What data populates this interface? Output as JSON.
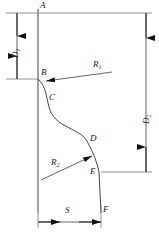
{
  "diagram": {
    "stroke_color": "#333333",
    "text_color": "#1a1a1a",
    "background_color": "#ffffff",
    "points": [
      {
        "id": "point-a",
        "label": "A",
        "x": 41,
        "y": 9,
        "label_x": 40,
        "label_y": 1
      },
      {
        "id": "point-b",
        "label": "B",
        "x": 38,
        "y": 79,
        "label_x": 41,
        "label_y": 68
      },
      {
        "id": "point-c",
        "label": "C",
        "x": 47,
        "y": 100,
        "label_x": 49,
        "label_y": 93
      },
      {
        "id": "point-d",
        "label": "D",
        "x": 88,
        "y": 143,
        "label_x": 90,
        "label_y": 134
      },
      {
        "id": "point-e",
        "label": "E",
        "x": 99,
        "y": 172,
        "label_x": 90,
        "label_y": 167
      },
      {
        "id": "point-f",
        "label": "F",
        "x": 101,
        "y": 213,
        "label_x": 103,
        "label_y": 205
      }
    ],
    "dimensions": [
      {
        "id": "dimension-d1",
        "label": "D",
        "subscript": "1",
        "orientation": "vertical",
        "side": "left",
        "label_x": 11,
        "label_y": 52
      },
      {
        "id": "dimension-d2",
        "label": "D",
        "subscript": "2",
        "orientation": "vertical",
        "side": "right",
        "label_x": 142,
        "label_y": 117
      },
      {
        "id": "dimension-s",
        "label": "S",
        "subscript": "",
        "orientation": "horizontal",
        "side": "bottom",
        "label_x": 65,
        "label_y": 206
      }
    ],
    "radii": [
      {
        "id": "radius-r1",
        "label": "R",
        "subscript": "1",
        "label_x": 93,
        "label_y": 60,
        "leader_from_x": 112,
        "leader_from_y": 72,
        "leader_to_x": 44,
        "leader_to_y": 81
      },
      {
        "id": "radius-r2",
        "label": "R",
        "subscript": "2",
        "label_x": 51,
        "label_y": 158,
        "leader_from_x": 41,
        "leader_from_y": 180,
        "leader_to_x": 93,
        "leader_to_y": 157
      }
    ]
  }
}
